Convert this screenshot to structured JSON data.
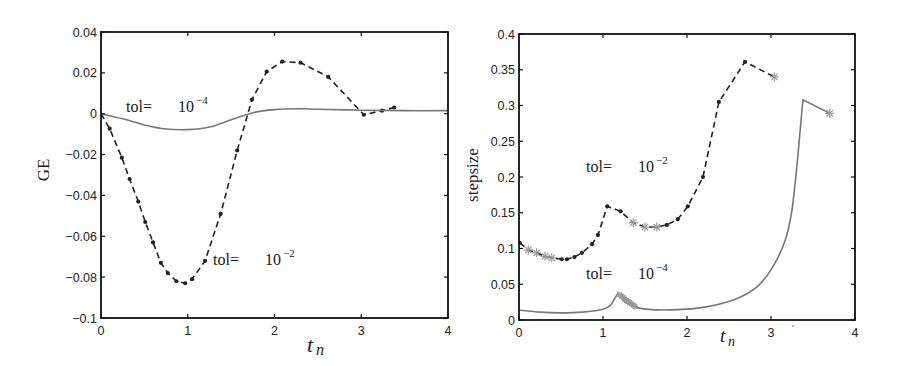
{
  "chart_data": [
    {
      "type": "line",
      "panel": "left",
      "title": "",
      "xlabel": "t_n",
      "ylabel": "GE",
      "xlim": [
        0,
        4
      ],
      "ylim": [
        -0.1,
        0.04
      ],
      "xticks": [
        0,
        1,
        2,
        3,
        4
      ],
      "xtick_labels": [
        "0",
        "1",
        "2",
        "3",
        "4"
      ],
      "yticks": [
        -0.1,
        -0.08,
        -0.06,
        -0.04,
        -0.02,
        0,
        0.02,
        0.04
      ],
      "ytick_labels": [
        "-0.1",
        "-0.08",
        "-0.06",
        "-0.04",
        "-0.02",
        "0",
        "0.02",
        "0.04"
      ],
      "grid": false,
      "legend": "none (inline annotations)",
      "series": [
        {
          "name": "tol = 10^-2",
          "style": "dashed with dot markers",
          "color": "#222222",
          "x": [
            0,
            0.1,
            0.24,
            0.33,
            0.43,
            0.51,
            0.6,
            0.69,
            0.77,
            0.87,
            0.97,
            1.05,
            1.2,
            1.38,
            1.57,
            1.74,
            1.91,
            2.09,
            2.3,
            2.62,
            3.03,
            3.24,
            3.38
          ],
          "y": [
            0,
            -0.0073,
            -0.0215,
            -0.032,
            -0.043,
            -0.053,
            -0.063,
            -0.073,
            -0.078,
            -0.082,
            -0.083,
            -0.081,
            -0.072,
            -0.049,
            -0.018,
            0.0069,
            0.0206,
            0.0255,
            0.025,
            0.018,
            -0.0005,
            0.0015,
            0.003
          ]
        },
        {
          "name": "tol = 10^-4",
          "style": "solid",
          "color": "#777777",
          "x": [
            0,
            0.25,
            0.5,
            0.75,
            1.0,
            1.25,
            1.5,
            1.75,
            2.0,
            2.25,
            2.5,
            3.0,
            3.5,
            4.0
          ],
          "y": [
            0,
            -0.0025,
            -0.0055,
            -0.0075,
            -0.0078,
            -0.0065,
            -0.003,
            0.0005,
            0.002,
            0.0024,
            0.0022,
            0.0017,
            0.0015,
            0.0015
          ]
        }
      ],
      "annotations": [
        {
          "text": "tol= 10^-4",
          "x": 0.2,
          "y": 0.003
        },
        {
          "text": "tol= 10^-2",
          "x": 1.27,
          "y": -0.073
        }
      ]
    },
    {
      "type": "line",
      "panel": "right",
      "title": "",
      "xlabel": "t_n",
      "ylabel": "stepsize",
      "xlim": [
        0,
        4
      ],
      "ylim": [
        0,
        0.4
      ],
      "xticks": [
        0,
        1,
        2,
        3,
        4
      ],
      "xtick_labels": [
        "0",
        "1",
        "2",
        "3",
        "4"
      ],
      "yticks": [
        0,
        0.05,
        0.1,
        0.15,
        0.2,
        0.25,
        0.3,
        0.35,
        0.4
      ],
      "ytick_labels": [
        "0",
        "0.05",
        "0.1",
        "0.15",
        "0.2",
        "0.25",
        "0.3",
        "0.35",
        "0.4"
      ],
      "grid": false,
      "legend": "none (inline annotations)",
      "series": [
        {
          "name": "tol = 10^-2",
          "style": "dashed with dot markers; gray asterisks mark rejected steps",
          "color": "#222222",
          "marker_color_rejected": "#999999",
          "x": [
            0.01,
            0.11,
            0.21,
            0.31,
            0.39,
            0.51,
            0.57,
            0.66,
            0.75,
            0.87,
            0.94,
            1.05,
            1.21,
            1.36,
            1.5,
            1.64,
            1.76,
            1.89,
            2.01,
            2.19,
            2.38,
            2.69,
            3.04
          ],
          "y": [
            0.108,
            0.098,
            0.094,
            0.089,
            0.087,
            0.085,
            0.085,
            0.088,
            0.094,
            0.106,
            0.119,
            0.159,
            0.152,
            0.136,
            0.13,
            0.13,
            0.133,
            0.141,
            0.159,
            0.2,
            0.305,
            0.361,
            0.34
          ],
          "marker": [
            "dot",
            "star",
            "star",
            "star",
            "star",
            "dot",
            "dot",
            "dot",
            "dot",
            "dot",
            "dot",
            "dot",
            "dot",
            "star",
            "star",
            "star",
            "dot",
            "dot",
            "dot",
            "dot",
            "dot",
            "dot",
            "star"
          ]
        },
        {
          "name": "tol = 10^-4",
          "style": "solid; gray asterisk cluster of rejected steps near t=1.2-1.4 and at end",
          "color": "#777777",
          "x": [
            0,
            0.25,
            0.5,
            0.75,
            1.0,
            1.1,
            1.18,
            1.25,
            1.42,
            1.7,
            2.15,
            2.55,
            2.83,
            3.02,
            3.17,
            3.25,
            3.32,
            3.38,
            3.7
          ],
          "y": [
            0.014,
            0.011,
            0.01,
            0.011,
            0.015,
            0.022,
            0.038,
            0.026,
            0.017,
            0.014,
            0.017,
            0.028,
            0.046,
            0.074,
            0.112,
            0.154,
            0.23,
            0.308,
            0.289
          ]
        }
      ],
      "annotations": [
        {
          "text": "tol= 10^-2",
          "x": 0.8,
          "y": 0.2
        },
        {
          "text": "tol= 10^-4",
          "x": 0.8,
          "y": 0.062
        }
      ]
    }
  ],
  "labels": {
    "left_ylabel": "GE",
    "right_ylabel": "stepsize",
    "xlabel_t": "t",
    "xlabel_sub": "n",
    "tol": "tol=",
    "ten": "10",
    "exp_m2": "−2",
    "exp_m4": "−4"
  }
}
